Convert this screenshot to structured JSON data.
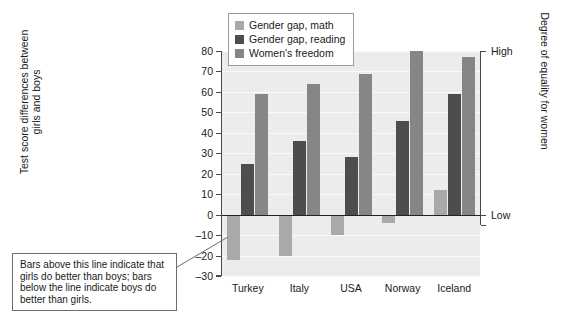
{
  "chart_data": {
    "type": "bar",
    "title": "",
    "subtitle": "",
    "categories": [
      "Turkey",
      "Italy",
      "USA",
      "Norway",
      "Iceland"
    ],
    "series": [
      {
        "name": "Gender gap, math",
        "color": "#a9a9a9",
        "values": [
          -22,
          -20,
          -10,
          -4,
          12
        ]
      },
      {
        "name": "Gender gap, reading",
        "color": "#4d4d4d",
        "values": [
          25,
          36,
          28,
          46,
          59
        ]
      },
      {
        "name": "Women's freedom",
        "color": "#868686",
        "values": [
          59,
          64,
          69,
          80,
          77
        ]
      }
    ],
    "xlabel": "",
    "ylabel": "Test score differences between\ngirls and boys",
    "ylim": [
      -30,
      80
    ],
    "yticks": [
      80,
      70,
      60,
      50,
      40,
      30,
      20,
      10,
      0,
      -10,
      -20,
      -30
    ],
    "ytick_labels": [
      "80",
      "70",
      "60",
      "50",
      "40",
      "30",
      "20",
      "10",
      "0",
      "–10",
      "–20",
      "–30"
    ],
    "grid": true,
    "legend_position": "top-left-inside",
    "secondary_axis": {
      "label": "Degree of equality for women",
      "ticks": [
        {
          "value": 80,
          "label": "High"
        },
        {
          "value": 0,
          "label": "Low"
        }
      ]
    },
    "annotations": [
      {
        "name": "zero-line-note",
        "text": "Bars above this line indicate that girls do better than boys; bars below the line indicate boys do better than girls.",
        "points_to": "zero-line"
      }
    ]
  },
  "legend": {
    "items": [
      {
        "label": "Gender gap, math",
        "color": "#a9a9a9"
      },
      {
        "label": "Gender gap, reading",
        "color": "#4d4d4d"
      },
      {
        "label": "Women's freedom",
        "color": "#868686"
      }
    ]
  },
  "axes": {
    "left_title": "Test score differences between\ngirls and boys",
    "right_title": "Degree of equality for women",
    "right_high": "High",
    "right_low": "Low"
  },
  "annotation": {
    "text": "Bars above this line indicate that girls do better than boys; bars below the line indicate boys do better than girls."
  }
}
